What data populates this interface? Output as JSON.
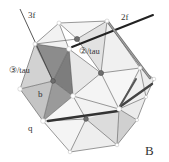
{
  "figure": {
    "panel_label": "B",
    "labels": {
      "axis_3f": "3f",
      "axis_2f": "2f",
      "site_3_tau": "③/tau",
      "site_2_tau": "②/tau",
      "site_b": "b",
      "site_q": "q"
    },
    "colors": {
      "edge": "#555555",
      "rod": "#3a3a3a",
      "face_dark": "#8c8c8c",
      "face_mid": "#b0b0b0",
      "face_light": "#d6d6d6",
      "face_pale": "#ececec",
      "node_dark": "#6e6e6e",
      "node_white": "#ffffff"
    }
  }
}
